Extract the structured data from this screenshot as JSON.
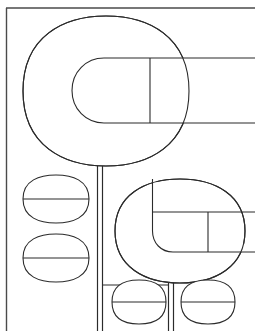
{
  "canvas": {
    "width": 255,
    "height": 331,
    "background": "#ffffff",
    "title": "Line Art Drawing",
    "description": "Black-and-white outline drawing of stylized plant or tree forms"
  },
  "style": {
    "stroke_color": "#2b2b2b",
    "frame_stroke_color": "#4a4a4a",
    "fill_color": "#ffffff",
    "stroke_width": 1.1,
    "frame_stroke_width": 1.4
  },
  "frame": {
    "name": "border-frame",
    "left_x": 6,
    "top_y": 8,
    "right_x": 255,
    "bottom_y": 331
  },
  "shapes": {
    "large_canopy": {
      "label": "large-canopy",
      "center_x": 106,
      "center_y": 91,
      "radius_x": 83,
      "radius_y": 75,
      "corner_radius": 62
    },
    "large_inner": {
      "label": "large-inner-stadium",
      "left_x": 72,
      "right_x": 255,
      "top_y": 58,
      "bottom_y": 123,
      "corner_radius": 32,
      "divider_x": 150
    },
    "large_stem": {
      "label": "large-stem",
      "left_x": 97,
      "right_x": 102,
      "top_y": 166,
      "bottom_y": 331
    },
    "small_canopy": {
      "label": "small-canopy",
      "center_x": 180,
      "center_y": 231,
      "radius_x": 65,
      "radius_y": 52,
      "corner_radius": 44
    },
    "small_inner": {
      "label": "small-inner-stadium",
      "left_x": 152,
      "right_x": 255,
      "top_y": 212,
      "bottom_y": 252,
      "corner_radius": 21,
      "divider_x": 208
    },
    "small_stem": {
      "label": "small-stem",
      "left_x": 168,
      "right_x": 173,
      "top_y": 283,
      "bottom_y": 331
    }
  },
  "leaves": [
    {
      "name": "leaf-left-upper",
      "center_x": 56,
      "center_y": 199,
      "half_width": 33,
      "half_height": 24
    },
    {
      "name": "leaf-left-lower",
      "center_x": 56,
      "center_y": 258,
      "half_width": 33,
      "half_height": 24
    },
    {
      "name": "leaf-bottom-left",
      "center_x": 139,
      "center_y": 302,
      "half_width": 27,
      "half_height": 22
    },
    {
      "name": "leaf-bottom-right",
      "center_x": 208,
      "center_y": 302,
      "half_width": 27,
      "half_height": 22
    }
  ],
  "connectors": [
    {
      "name": "connector-large-to-small",
      "x1": 102,
      "y1": 285,
      "x2": 168,
      "y2": 285
    }
  ]
}
